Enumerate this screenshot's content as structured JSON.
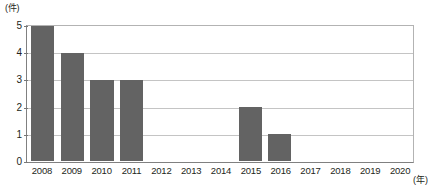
{
  "chart": {
    "unit_y": "(件)",
    "unit_x": "(年)"
  },
  "chart_data": {
    "type": "bar",
    "title": "",
    "subtitle": "",
    "xlabel": "(年)",
    "ylabel": "(件)",
    "categories": [
      "2008",
      "2009",
      "2010",
      "2011",
      "2012",
      "2013",
      "2014",
      "2015",
      "2016",
      "2017",
      "2018",
      "2019",
      "2020"
    ],
    "values": [
      5,
      4,
      3,
      3,
      0,
      0,
      0,
      2,
      1,
      0,
      0,
      0,
      0
    ],
    "ylim": [
      0,
      5
    ],
    "yticks": [
      "0",
      "1",
      "2",
      "3",
      "4",
      "5"
    ],
    "grid": true,
    "legend": "none",
    "bar_color": "#636363",
    "grid_color": "#c4c4c4",
    "axis_color": "#808080"
  }
}
